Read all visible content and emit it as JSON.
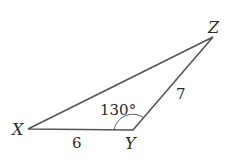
{
  "diagram": {
    "type": "triangle",
    "vertices": {
      "X": {
        "label": "X"
      },
      "Y": {
        "label": "Y"
      },
      "Z": {
        "label": "Z"
      }
    },
    "sides": {
      "XY": {
        "label": "6"
      },
      "YZ": {
        "label": "7"
      }
    },
    "angles": {
      "Y": {
        "label": "130°"
      }
    },
    "colors": {
      "stroke": "#555555",
      "text": "#2a2a2a"
    }
  }
}
